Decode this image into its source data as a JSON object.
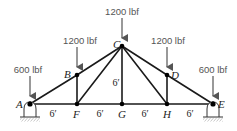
{
  "diagram": {
    "type": "truss",
    "colors": {
      "member": "#1a1a1a",
      "load_arrow": "#555555",
      "load_text": "#555555",
      "hatch": "#777777"
    },
    "nodes": [
      {
        "id": "A",
        "label": "A",
        "x": 30,
        "y": 104
      },
      {
        "id": "F",
        "label": "F",
        "x": 77,
        "y": 104
      },
      {
        "id": "G",
        "label": "G",
        "x": 122,
        "y": 104
      },
      {
        "id": "H",
        "label": "H",
        "x": 167,
        "y": 104
      },
      {
        "id": "E",
        "label": "E",
        "x": 213,
        "y": 104
      },
      {
        "id": "B",
        "label": "B",
        "x": 77,
        "y": 75
      },
      {
        "id": "C",
        "label": "C",
        "x": 122,
        "y": 46
      },
      {
        "id": "D",
        "label": "D",
        "x": 167,
        "y": 75
      }
    ],
    "loads": [
      {
        "node": "A",
        "label": "600 lbf"
      },
      {
        "node": "B",
        "label": "1200 lbf"
      },
      {
        "node": "C",
        "label": "1200 lbf"
      },
      {
        "node": "D",
        "label": "1200 lbf"
      },
      {
        "node": "E",
        "label": "600 lbf"
      }
    ],
    "dimensions": [
      {
        "label": "6′",
        "between": "A-F"
      },
      {
        "label": "6′",
        "between": "F-G"
      },
      {
        "label": "6′",
        "between": "G-H"
      },
      {
        "label": "6′",
        "between": "H-E"
      },
      {
        "label": "6′",
        "between": "G-C",
        "orientation": "vertical"
      }
    ],
    "supports": [
      {
        "node": "A",
        "type": "pin"
      },
      {
        "node": "E",
        "type": "pin"
      }
    ]
  }
}
